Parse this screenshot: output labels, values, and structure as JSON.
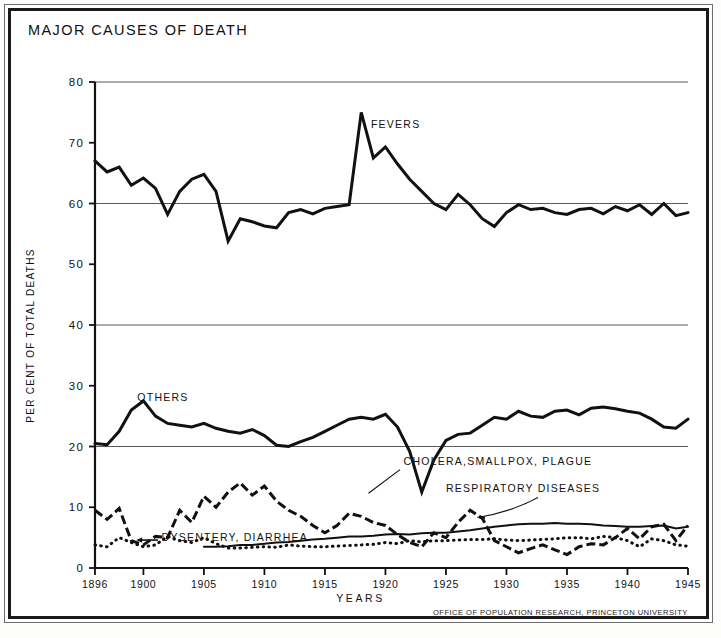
{
  "title": "MAJOR CAUSES OF DEATH",
  "credit": "OFFICE OF POPULATION RESEARCH, PRINCETON UNIVERSITY",
  "labels": {
    "fevers": "FEVERS",
    "others": "OTHERS",
    "cholera": "CHOLERA,SMALLPOX, PLAGUE",
    "respiratory": "RESPIRATORY DISEASES",
    "dysentery": "DYSENTERY, DIARRHEA"
  },
  "chart_data": {
    "type": "line",
    "title": "MAJOR CAUSES OF DEATH",
    "xlabel": "YEARS",
    "ylabel": "PER CENT OF TOTAL DEATHS",
    "xlim": [
      1896,
      1945
    ],
    "ylim": [
      0,
      80
    ],
    "ytick_values": [
      0,
      10,
      20,
      30,
      40,
      50,
      60,
      70,
      80
    ],
    "ytick_labels": [
      "0",
      "10",
      "20",
      "30",
      "40",
      "50",
      "60",
      "70",
      "80"
    ],
    "xtick_values": [
      1896,
      1900,
      1905,
      1910,
      1915,
      1920,
      1925,
      1930,
      1935,
      1940,
      1945
    ],
    "xtick_labels": [
      "1896",
      "1900",
      "1905",
      "1910",
      "1915",
      "1920",
      "1925",
      "1930",
      "1935",
      "1940",
      "1945"
    ],
    "gridlines_y": [
      20,
      40,
      60,
      80
    ],
    "grid": "horizontal-major",
    "legend": "inline-annotations",
    "x": [
      1896,
      1897,
      1898,
      1899,
      1900,
      1901,
      1902,
      1903,
      1904,
      1905,
      1906,
      1907,
      1908,
      1909,
      1910,
      1911,
      1912,
      1913,
      1914,
      1915,
      1916,
      1917,
      1918,
      1919,
      1920,
      1921,
      1922,
      1923,
      1924,
      1925,
      1926,
      1927,
      1928,
      1929,
      1930,
      1931,
      1932,
      1933,
      1934,
      1935,
      1936,
      1937,
      1938,
      1939,
      1940,
      1941,
      1942,
      1943,
      1944,
      1945
    ],
    "series": [
      {
        "name": "FEVERS",
        "style": "solid-thick",
        "values": [
          67.0,
          65.2,
          66.0,
          63.0,
          64.2,
          62.5,
          58.2,
          62.0,
          64.0,
          64.8,
          62.0,
          53.8,
          57.5,
          57.0,
          56.3,
          56.0,
          58.5,
          59.0,
          58.3,
          59.2,
          59.5,
          59.8,
          75.0,
          67.5,
          69.3,
          66.5,
          64.0,
          62.0,
          60.0,
          59.0,
          61.5,
          59.8,
          57.5,
          56.2,
          58.5,
          59.8,
          59.0,
          59.2,
          58.5,
          58.2,
          59.0,
          59.2,
          58.3,
          59.5,
          58.8,
          59.8,
          58.2,
          60.0,
          58.0,
          58.5
        ]
      },
      {
        "name": "OTHERS",
        "style": "solid-thick",
        "values": [
          20.5,
          20.3,
          22.5,
          26.0,
          27.5,
          25.0,
          23.8,
          23.5,
          23.2,
          23.8,
          23.0,
          22.5,
          22.2,
          22.8,
          21.8,
          20.2,
          20.0,
          20.8,
          21.5,
          22.5,
          23.5,
          24.5,
          24.8,
          24.5,
          25.3,
          23.2,
          19.2,
          12.5,
          17.8,
          21.0,
          22.0,
          22.2,
          23.5,
          24.8,
          24.5,
          25.8,
          25.0,
          24.8,
          25.8,
          26.0,
          25.2,
          26.3,
          26.5,
          26.2,
          25.8,
          25.5,
          24.5,
          23.2,
          23.0,
          24.5
        ]
      },
      {
        "name": "CHOLERA,SMALLPOX, PLAGUE",
        "style": "dashed",
        "values": [
          9.5,
          8.0,
          9.8,
          4.5,
          3.8,
          5.2,
          5.0,
          9.5,
          7.5,
          11.8,
          10.0,
          12.5,
          14.0,
          12.0,
          13.5,
          11.0,
          9.5,
          8.5,
          7.0,
          5.8,
          7.0,
          9.0,
          8.5,
          7.5,
          7.0,
          5.5,
          4.2,
          3.5,
          5.8,
          5.0,
          7.5,
          9.5,
          8.2,
          4.5,
          3.5,
          2.5,
          3.2,
          3.8,
          3.0,
          2.2,
          3.5,
          4.0,
          3.8,
          5.0,
          6.5,
          4.8,
          6.8,
          7.2,
          4.5,
          7.0
        ]
      },
      {
        "name": "RESPIRATORY DISEASES",
        "style": "solid-thin",
        "values": [
          null,
          null,
          null,
          null,
          null,
          null,
          null,
          null,
          null,
          3.5,
          3.5,
          3.6,
          3.8,
          3.8,
          4.0,
          4.2,
          4.3,
          4.5,
          4.7,
          4.8,
          5.0,
          5.2,
          5.2,
          5.3,
          5.5,
          5.6,
          5.5,
          5.7,
          5.8,
          5.8,
          6.0,
          6.2,
          6.5,
          6.8,
          7.0,
          7.2,
          7.3,
          7.3,
          7.4,
          7.3,
          7.3,
          7.2,
          7.0,
          6.9,
          6.8,
          6.8,
          6.9,
          7.0,
          6.5,
          6.8
        ]
      },
      {
        "name": "DYSENTERY, DIARRHEA",
        "style": "dotted",
        "values": [
          3.8,
          3.5,
          5.0,
          4.2,
          3.5,
          3.8,
          5.2,
          4.5,
          4.2,
          5.0,
          4.0,
          3.3,
          3.3,
          3.4,
          3.5,
          3.4,
          3.8,
          3.6,
          3.5,
          3.5,
          3.6,
          3.7,
          3.8,
          3.9,
          4.2,
          4.0,
          4.5,
          4.3,
          4.5,
          4.5,
          4.6,
          4.7,
          4.7,
          4.8,
          4.6,
          4.5,
          4.6,
          4.7,
          4.8,
          5.0,
          5.0,
          4.8,
          5.2,
          5.0,
          4.5,
          3.5,
          4.8,
          4.5,
          3.8,
          3.6
        ]
      }
    ],
    "annotations": [
      {
        "text": "FEVERS",
        "x": 1918.8,
        "y": 72.5
      },
      {
        "text": "OTHERS",
        "x": 1899.5,
        "y": 27.5
      },
      {
        "text": "CHOLERA,SMALLPOX, PLAGUE",
        "x": 1921.5,
        "y": 17.0
      },
      {
        "text": "RESPIRATORY DISEASES",
        "x": 1925.0,
        "y": 12.5
      },
      {
        "text": "DYSENTERY, DIARRHEA",
        "x": 1901.5,
        "y": 4.5
      }
    ]
  }
}
